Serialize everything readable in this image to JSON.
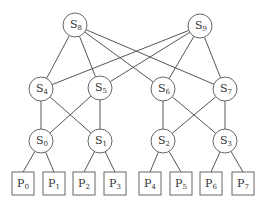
{
  "diagram": {
    "type": "multistage interconnection network",
    "switches": [
      {
        "id": "S8",
        "base": "S",
        "sub": "8",
        "x": 75,
        "y": 25
      },
      {
        "id": "S9",
        "base": "S",
        "sub": "9",
        "x": 200,
        "y": 26
      },
      {
        "id": "S4",
        "base": "S",
        "sub": "4",
        "x": 41,
        "y": 89
      },
      {
        "id": "S5",
        "base": "S",
        "sub": "5",
        "x": 100,
        "y": 88
      },
      {
        "id": "S6",
        "base": "S",
        "sub": "6",
        "x": 163,
        "y": 89
      },
      {
        "id": "S7",
        "base": "S",
        "sub": "7",
        "x": 225,
        "y": 89
      },
      {
        "id": "S0",
        "base": "S",
        "sub": "0",
        "x": 41,
        "y": 141
      },
      {
        "id": "S1",
        "base": "S",
        "sub": "1",
        "x": 100,
        "y": 141
      },
      {
        "id": "S2",
        "base": "S",
        "sub": "2",
        "x": 163,
        "y": 141
      },
      {
        "id": "S3",
        "base": "S",
        "sub": "3",
        "x": 225,
        "y": 141
      }
    ],
    "processors": [
      {
        "id": "P0",
        "base": "P",
        "sub": "0",
        "x": 12,
        "y": 172
      },
      {
        "id": "P1",
        "base": "P",
        "sub": "1",
        "x": 43,
        "y": 172
      },
      {
        "id": "P2",
        "base": "P",
        "sub": "2",
        "x": 73,
        "y": 172
      },
      {
        "id": "P3",
        "base": "P",
        "sub": "3",
        "x": 104,
        "y": 172
      },
      {
        "id": "P4",
        "base": "P",
        "sub": "4",
        "x": 139,
        "y": 172
      },
      {
        "id": "P5",
        "base": "P",
        "sub": "5",
        "x": 170,
        "y": 172
      },
      {
        "id": "P6",
        "base": "P",
        "sub": "6",
        "x": 200,
        "y": 172
      },
      {
        "id": "P7",
        "base": "P",
        "sub": "7",
        "x": 232,
        "y": 172
      }
    ],
    "switch_edges": [
      [
        "S8",
        "S4"
      ],
      [
        "S8",
        "S5"
      ],
      [
        "S8",
        "S6"
      ],
      [
        "S8",
        "S7"
      ],
      [
        "S9",
        "S4"
      ],
      [
        "S9",
        "S5"
      ],
      [
        "S9",
        "S6"
      ],
      [
        "S9",
        "S7"
      ],
      [
        "S4",
        "S0"
      ],
      [
        "S4",
        "S1"
      ],
      [
        "S5",
        "S0"
      ],
      [
        "S5",
        "S1"
      ],
      [
        "S6",
        "S2"
      ],
      [
        "S6",
        "S3"
      ],
      [
        "S7",
        "S2"
      ],
      [
        "S7",
        "S3"
      ]
    ],
    "processor_edges": [
      [
        "S0",
        "P0"
      ],
      [
        "S0",
        "P1"
      ],
      [
        "S1",
        "P2"
      ],
      [
        "S1",
        "P3"
      ],
      [
        "S2",
        "P4"
      ],
      [
        "S2",
        "P5"
      ],
      [
        "S3",
        "P6"
      ],
      [
        "S3",
        "P7"
      ]
    ],
    "node_radius": 12,
    "box_width": 22,
    "box_height": 23
  }
}
